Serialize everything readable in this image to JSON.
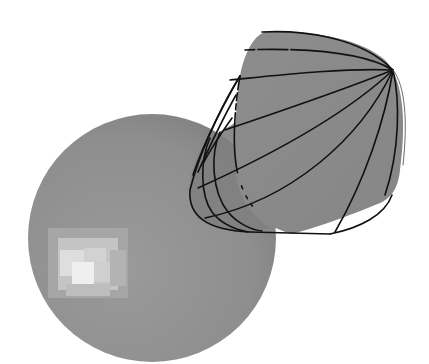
{
  "figure": {
    "objects": [
      {
        "id": "sphere",
        "label": "sphere",
        "fill": "#8f8f8f",
        "highlight": "#e6e6e6"
      },
      {
        "id": "cone-surface",
        "label": "rounded cone surface",
        "fill": "#8a8a8a",
        "edge": "#111111"
      }
    ],
    "meridian_count": 7,
    "inner_ring_count": 3,
    "colors": {
      "background": "#ffffff",
      "sphere_base": "#8f8f8f",
      "sphere_shadow": "#7c7c7c",
      "sphere_highlight": "#eeeeee",
      "cone_fill": "#8a8a8a",
      "cone_inner": "#7e7e7e",
      "curve_stroke": "#111111"
    }
  }
}
